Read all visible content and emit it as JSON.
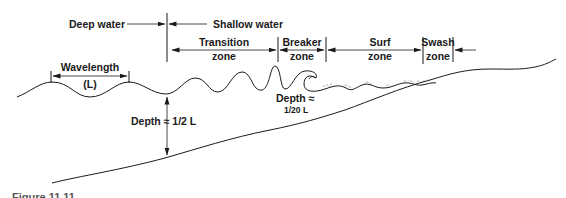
{
  "diagram": {
    "labels": {
      "deep_water": "Deep water",
      "shallow_water": "Shallow water",
      "transition_line1": "Transition",
      "transition_line2": "zone",
      "breaker_line1": "Breaker",
      "breaker_line2": "zone",
      "surf_line1": "Surf",
      "surf_line2": "zone",
      "swash_line1": "Swash",
      "swash_line2": "zone",
      "wavelength": "Wavelength",
      "wavelength_symbol": "(L)",
      "depth_deep": "Depth ≈ 1/2 L",
      "depth_breaker_line1": "Depth ≈",
      "depth_breaker_line2": "1/20 L"
    },
    "caption": "Figure 11.11"
  }
}
